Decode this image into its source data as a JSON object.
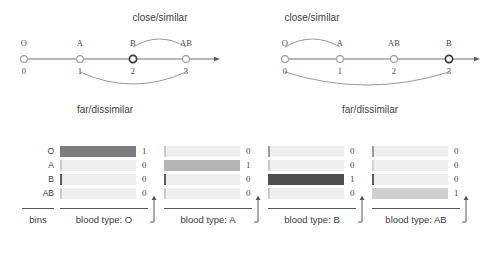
{
  "figure": {
    "title_text": "",
    "background": "#ffffff",
    "ink": "#3a3a3a"
  },
  "numberlines": [
    {
      "id": "numberline-left",
      "ticks": [
        {
          "name": "O",
          "number": "0",
          "x": 24,
          "highlighted": false
        },
        {
          "name": "A",
          "number": "1",
          "x": 80,
          "highlighted": false
        },
        {
          "name": "B",
          "number": "2",
          "x": 133,
          "highlighted": true
        },
        {
          "name": "AB",
          "number": "3",
          "x": 186,
          "highlighted": false
        }
      ],
      "axis": {
        "x1": 24,
        "x2": 218,
        "y": 59
      },
      "arc_top": {
        "label": "close/similar",
        "label_x": 160,
        "label_y": 12,
        "from_x": 133,
        "to_x": 186,
        "y": 47,
        "rise": 16
      },
      "arc_bottom": {
        "label": "far/dissimilar",
        "label_x": 105,
        "label_y": 104,
        "from_x": 80,
        "to_x": 186,
        "y": 72,
        "drop": 24
      }
    },
    {
      "id": "numberline-right",
      "ticks": [
        {
          "name": "O",
          "number": "0",
          "x": 39,
          "highlighted": false
        },
        {
          "name": "A",
          "number": "1",
          "x": 94,
          "highlighted": false
        },
        {
          "name": "AB",
          "number": "2",
          "x": 148,
          "highlighted": false
        },
        {
          "name": "B",
          "number": "3",
          "x": 203,
          "highlighted": true
        }
      ],
      "axis": {
        "x1": 39,
        "x2": 232,
        "y": 59
      },
      "arc_top": {
        "label": "close/similar",
        "label_x": 66,
        "label_y": 12,
        "from_x": 39,
        "to_x": 94,
        "y": 47,
        "rise": 16
      },
      "arc_bottom": {
        "label": "far/dissimilar",
        "label_x": 124,
        "label_y": 104,
        "from_x": 39,
        "to_x": 203,
        "y": 72,
        "drop": 26
      }
    }
  ],
  "heatmap": {
    "bins_caption": "bins",
    "bin_names": [
      "O",
      "A",
      "B",
      "AB"
    ],
    "palette": {
      "off": "#efefef",
      "edge": "#9a9a9a",
      "edge_strong": "#5d5d5d"
    },
    "panels": [
      {
        "id": "heat-panel-0",
        "caption": "blood type: O",
        "values": [
          "1",
          "0",
          "0",
          "0"
        ],
        "cells": [
          {
            "fill": "#7c7c7c",
            "edge": "#7c7c7c",
            "edge_strength": "none"
          },
          {
            "fill": "#efefef",
            "edge": "#c9c9c9",
            "edge_strength": "light"
          },
          {
            "fill": "#efefef",
            "edge": "#5d5d5d",
            "edge_strength": "strong"
          },
          {
            "fill": "#efefef",
            "edge": "#c9c9c9",
            "edge_strength": "light"
          }
        ]
      },
      {
        "id": "heat-panel-1",
        "caption": "blood type: A",
        "values": [
          "0",
          "1",
          "0",
          "0"
        ],
        "cells": [
          {
            "fill": "#efefef",
            "edge": "#c9c9c9",
            "edge_strength": "light"
          },
          {
            "fill": "#b4b4b4",
            "edge": "#b4b4b4",
            "edge_strength": "none"
          },
          {
            "fill": "#efefef",
            "edge": "#5d5d5d",
            "edge_strength": "strong"
          },
          {
            "fill": "#efefef",
            "edge": "#c9c9c9",
            "edge_strength": "light"
          }
        ]
      },
      {
        "id": "heat-panel-2",
        "caption": "blood type: B",
        "values": [
          "0",
          "0",
          "1",
          "0"
        ],
        "cells": [
          {
            "fill": "#efefef",
            "edge": "#9a9a9a",
            "edge_strength": "light"
          },
          {
            "fill": "#efefef",
            "edge": "#c9c9c9",
            "edge_strength": "light"
          },
          {
            "fill": "#4f4f4f",
            "edge": "#4f4f4f",
            "edge_strength": "none"
          },
          {
            "fill": "#efefef",
            "edge": "#c9c9c9",
            "edge_strength": "light"
          }
        ]
      },
      {
        "id": "heat-panel-3",
        "caption": "blood type: AB",
        "values": [
          "0",
          "0",
          "0",
          "1"
        ],
        "cells": [
          {
            "fill": "#efefef",
            "edge": "#9a9a9a",
            "edge_strength": "light"
          },
          {
            "fill": "#efefef",
            "edge": "#d2d2d2",
            "edge_strength": "light"
          },
          {
            "fill": "#efefef",
            "edge": "#5d5d5d",
            "edge_strength": "strong"
          },
          {
            "fill": "#cfcfcf",
            "edge": "#cfcfcf",
            "edge_strength": "none"
          }
        ]
      }
    ]
  },
  "chart_data": {
    "type": "heatmap",
    "xlabel": "blood type",
    "ylabel": "bins",
    "categories": [
      "O",
      "A",
      "B",
      "AB"
    ],
    "columns": [
      "blood type: O",
      "blood type: A",
      "blood type: B",
      "blood type: AB"
    ],
    "rows": [
      "O",
      "A",
      "B",
      "AB"
    ],
    "values": [
      [
        1,
        0,
        0,
        0
      ],
      [
        0,
        1,
        0,
        0
      ],
      [
        0,
        0,
        1,
        0
      ],
      [
        0,
        0,
        0,
        1
      ]
    ],
    "grid": false,
    "legend": "none",
    "annotations": [
      "close/similar",
      "far/dissimilar"
    ],
    "number_lines": [
      {
        "labels": [
          "O",
          "A",
          "B",
          "AB"
        ],
        "positions": [
          0,
          1,
          2,
          3
        ],
        "highlighted": "B",
        "close_pair": [
          "B",
          "AB"
        ],
        "far_pair": [
          "A",
          "AB"
        ]
      },
      {
        "labels": [
          "O",
          "A",
          "AB",
          "B"
        ],
        "positions": [
          0,
          1,
          2,
          3
        ],
        "highlighted": "B",
        "close_pair": [
          "O",
          "A"
        ],
        "far_pair": [
          "O",
          "B"
        ]
      }
    ]
  }
}
